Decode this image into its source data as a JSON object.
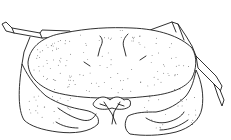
{
  "image": {
    "subject": "crab line drawing (dorsal view)",
    "background_color": "#ffffff",
    "line_color": "#1a1a1a",
    "style": "stippled scientific illustration"
  }
}
